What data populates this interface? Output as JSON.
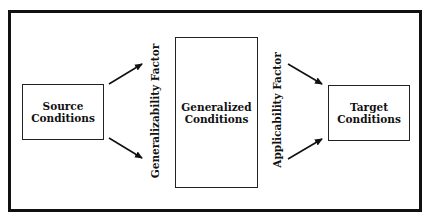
{
  "diagram": {
    "nodes": [
      {
        "id": "source",
        "lines": [
          "Source",
          "Conditions"
        ]
      },
      {
        "id": "generalized",
        "lines": [
          "Generalized",
          "Conditions"
        ]
      },
      {
        "id": "target",
        "lines": [
          "Target",
          "Conditions"
        ]
      }
    ],
    "factors": {
      "generalizability": "Generalizability Factor",
      "applicability": "Applicability Factor"
    },
    "edges": [
      {
        "from": "source",
        "to": "generalized",
        "label": "Generalizability Factor"
      },
      {
        "from": "generalized",
        "to": "target",
        "label": "Applicability Factor"
      }
    ],
    "colors": {
      "line": "#111111",
      "background": "#ffffff"
    }
  }
}
